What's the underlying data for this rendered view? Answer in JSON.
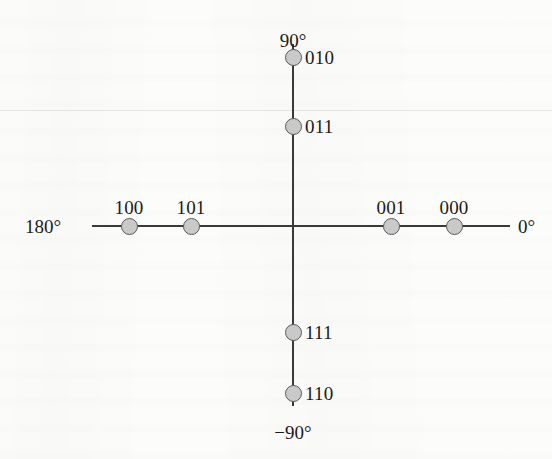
{
  "figure": {
    "type": "phase-axis-diagram",
    "background_color": "#fcfcfa",
    "line_color": "#3a3a3a",
    "node_fill_color": "#c9c9c9",
    "node_border_color": "#5a5a5a",
    "text_color": "#1a1a1a"
  },
  "axes": {
    "horizontal": {
      "left_label": "180°",
      "right_label": "0°",
      "y": 226,
      "x_start": 92,
      "x_end": 510
    },
    "vertical": {
      "top_label": "90°",
      "bottom_label": "−90°",
      "x": 293,
      "y_start": 44,
      "y_end": 406
    }
  },
  "points": [
    {
      "label": "010",
      "x": 293,
      "y": 57,
      "label_x": 305,
      "label_y": 57,
      "label_pos": "right",
      "phase_deg": 90
    },
    {
      "label": "011",
      "x": 293,
      "y": 126,
      "label_x": 305,
      "label_y": 126,
      "label_pos": "right",
      "phase_deg": 90
    },
    {
      "label": "111",
      "x": 293,
      "y": 332,
      "label_x": 305,
      "label_y": 332,
      "label_pos": "right",
      "phase_deg": -90
    },
    {
      "label": "110",
      "x": 293,
      "y": 393,
      "label_x": 305,
      "label_y": 393,
      "label_pos": "right",
      "phase_deg": -90
    },
    {
      "label": "100",
      "x": 129,
      "y": 226,
      "label_x": 129,
      "label_y": 198,
      "label_pos": "above",
      "phase_deg": 180
    },
    {
      "label": "101",
      "x": 191,
      "y": 226,
      "label_x": 191,
      "label_y": 198,
      "label_pos": "above",
      "phase_deg": 180
    },
    {
      "label": "001",
      "x": 391,
      "y": 226,
      "label_x": 391,
      "label_y": 198,
      "label_pos": "above",
      "phase_deg": 0
    },
    {
      "label": "000",
      "x": 454,
      "y": 226,
      "label_x": 454,
      "label_y": 198,
      "label_pos": "above",
      "phase_deg": 0
    }
  ],
  "axis_end_labels": {
    "left": {
      "text": "180°",
      "x": 25,
      "y": 226
    },
    "right": {
      "text": "0°",
      "x": 518,
      "y": 226
    },
    "top": {
      "text": "90°",
      "x": 293,
      "y": 31
    },
    "bottom": {
      "text": "−90°",
      "x": 293,
      "y": 423
    }
  },
  "chart_data": {
    "type": "scatter",
    "xlabel": "",
    "ylabel": "",
    "xlim": [
      -4,
      4
    ],
    "ylim": [
      -4,
      4
    ],
    "grid": false,
    "legend": null,
    "annotations": [
      "90°",
      "180°",
      "0°",
      "−90°"
    ],
    "categories": [
      "010",
      "011",
      "111",
      "110",
      "100",
      "101",
      "001",
      "000"
    ],
    "series": [
      {
        "name": "constellation points",
        "points": [
          {
            "label": "010",
            "x": 0,
            "y": 3,
            "axis": "vertical",
            "phase_deg": 90
          },
          {
            "label": "011",
            "x": 0,
            "y": 1.5,
            "axis": "vertical",
            "phase_deg": 90
          },
          {
            "label": "111",
            "x": 0,
            "y": -2.3,
            "axis": "vertical",
            "phase_deg": -90
          },
          {
            "label": "110",
            "x": 0,
            "y": -3.6,
            "axis": "vertical",
            "phase_deg": -90
          },
          {
            "label": "100",
            "x": -3.5,
            "y": 0,
            "axis": "horizontal",
            "phase_deg": 180
          },
          {
            "label": "101",
            "x": -2.2,
            "y": 0,
            "axis": "horizontal",
            "phase_deg": 180
          },
          {
            "label": "001",
            "x": 2.1,
            "y": 0,
            "axis": "horizontal",
            "phase_deg": 0
          },
          {
            "label": "000",
            "x": 3.4,
            "y": 0,
            "axis": "horizontal",
            "phase_deg": 0
          }
        ]
      }
    ]
  }
}
